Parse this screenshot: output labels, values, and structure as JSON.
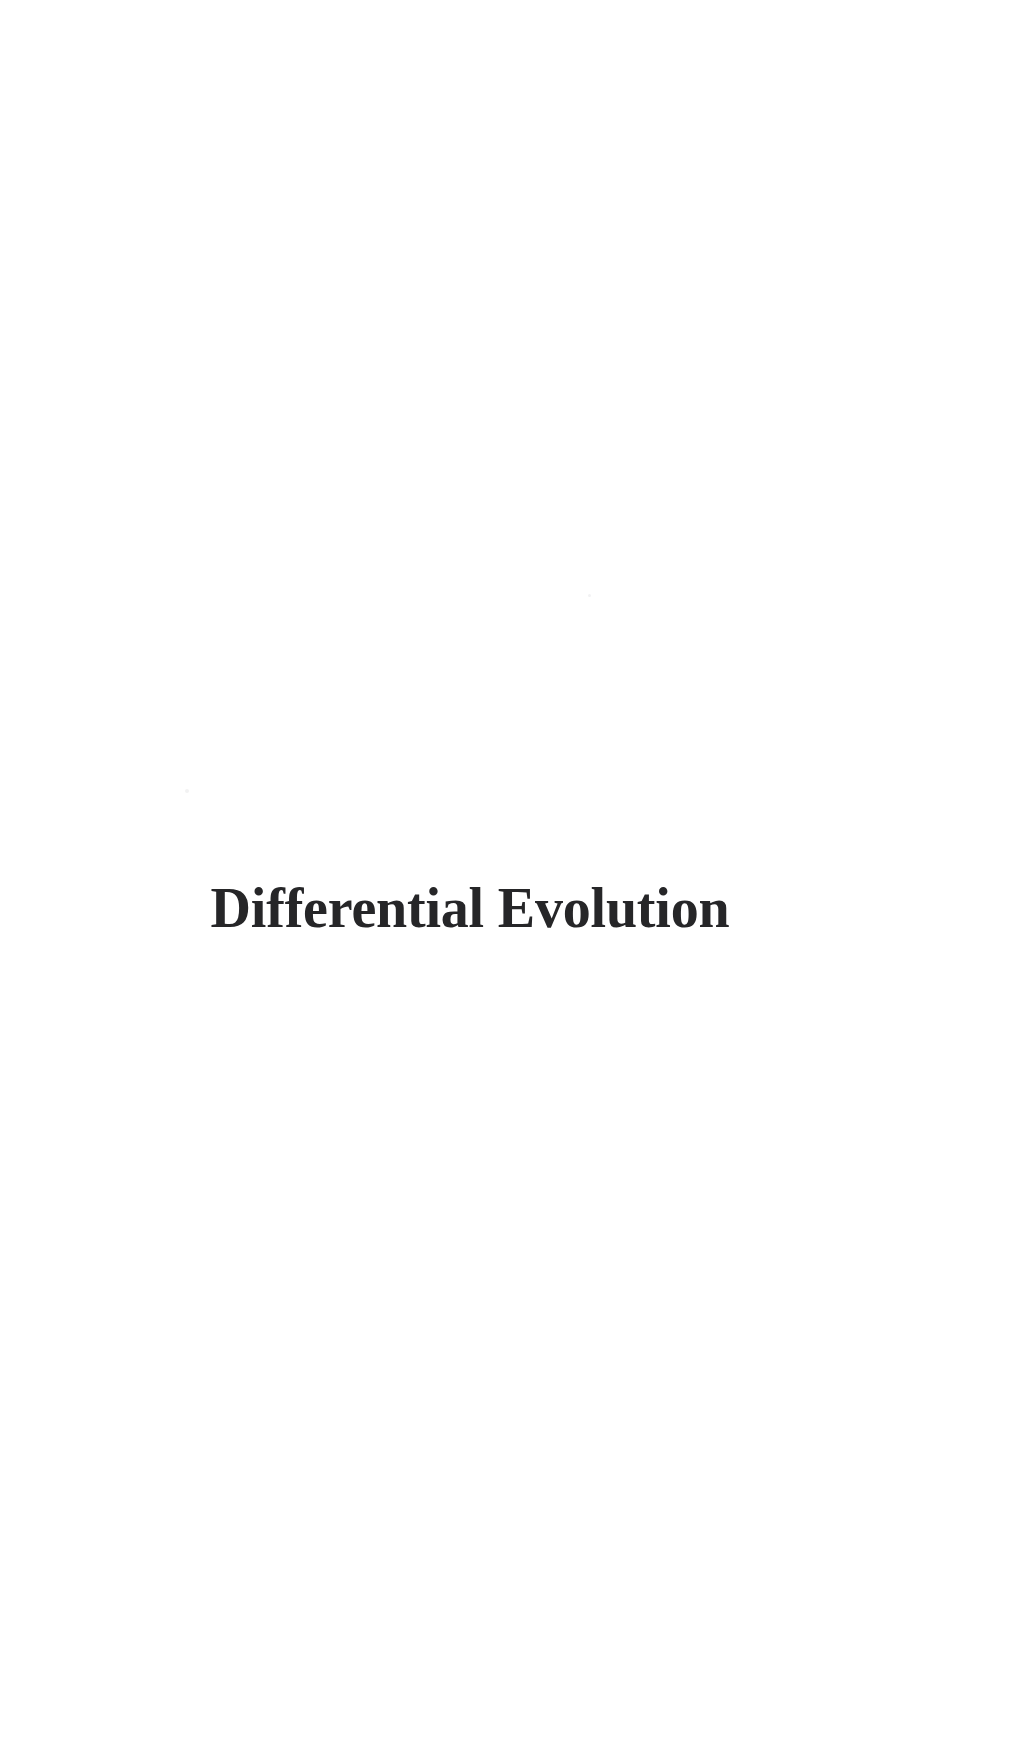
{
  "page": {
    "background_color": "#ffffff",
    "width": 1019,
    "height": 1764
  },
  "part_title": {
    "text": "Differential Evolution",
    "color": "#262628"
  },
  "artifacts": [
    {
      "name": "scan-speckle-upper",
      "x": 588,
      "y": 594,
      "size": 3
    },
    {
      "name": "scan-speckle-lower",
      "x": 185,
      "y": 789,
      "size": 4
    }
  ]
}
